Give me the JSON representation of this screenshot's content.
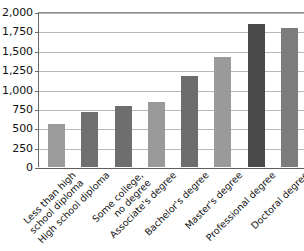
{
  "chart_data": {
    "type": "bar",
    "title": "",
    "subtitle": "",
    "xlabel": "",
    "ylabel": "",
    "categories": [
      "Less than high\nschool diploma",
      "High school diploma",
      "Some college,\nno degree",
      "Associate's degree",
      "Bachelor's degree",
      "Master's degree",
      "Professional degree",
      "Doctoral degree"
    ],
    "values": [
      555,
      715,
      785,
      840,
      1170,
      1415,
      1850,
      1790
    ],
    "ylim": [
      0,
      2000
    ],
    "yticks": [
      0,
      250,
      500,
      750,
      1000,
      1250,
      1500,
      1750,
      2000
    ],
    "ytick_labels": [
      "0",
      "250",
      "500",
      "750",
      "1,000",
      "1,250",
      "1,500",
      "1,750",
      "2,000"
    ],
    "grid": true,
    "legend": "none",
    "bar_colors": [
      "#9b9b9b",
      "#6f6f6f",
      "#6e6e6e",
      "#9a9a9a",
      "#6d6d6d",
      "#9a9a9a",
      "#4a4a4a",
      "#7c7c7c"
    ]
  },
  "axis": {
    "line_color": "#6a6a6a",
    "grid_color": "#b9b9b9"
  }
}
